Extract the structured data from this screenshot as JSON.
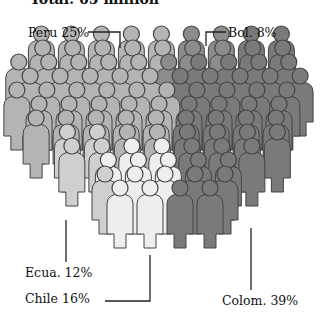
{
  "chart_data": {
    "type": "pie",
    "style": "pictogram of people figures arranged in an oval crowd, segmented by shade",
    "title": "Total: 65 million",
    "categories": [
      "Peru",
      "Bol.",
      "Colom.",
      "Chile",
      "Ecua."
    ],
    "values": [
      25,
      8,
      39,
      16,
      12
    ],
    "unit": "%",
    "labels": [
      "Peru 25%",
      "Bol. 8%",
      "Colom. 39%",
      "Chile 16%",
      "Ecua. 12%"
    ],
    "colors": {
      "Peru": "#b4b4b4",
      "Bol.": "#8c8c8c",
      "Colom.": "#7a7a7a",
      "Chile": "#eeeeee",
      "Ecua.": "#cfcfcf"
    },
    "legend": "none (leader-line callouts)"
  }
}
